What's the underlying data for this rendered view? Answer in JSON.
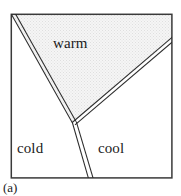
{
  "figure": {
    "caption": "(a)",
    "frame": {
      "left": 11,
      "top": 14,
      "right": 172,
      "bottom": 178,
      "stroke_color": "#3a3a3a",
      "stroke_width": 1.6
    },
    "shaded_region": {
      "name": "warm-sector",
      "fill_color": "#e9e9e9",
      "stipple": true
    },
    "boundary_style": {
      "stroke_color": "#2b2b2b",
      "stroke_width": 1.2,
      "double_line_gap": 3.2
    },
    "junction_point": {
      "x": 73,
      "y": 122
    },
    "boundaries": [
      {
        "name": "warm-front-left",
        "from": {
          "x": 12,
          "y": 15
        },
        "to": {
          "x": 73,
          "y": 122
        }
      },
      {
        "name": "warm-front-right",
        "from": {
          "x": 73,
          "y": 122
        },
        "to": {
          "x": 171,
          "y": 39
        }
      },
      {
        "name": "occlusion-vertical",
        "from": {
          "x": 73,
          "y": 122
        },
        "to": {
          "x": 91,
          "y": 178
        }
      }
    ],
    "labels": [
      {
        "key": "warm",
        "text": "warm"
      },
      {
        "key": "cold",
        "text": "cold"
      },
      {
        "key": "cool",
        "text": "cool"
      }
    ],
    "regions": {
      "warm": "warm",
      "cold": "cold",
      "cool": "cool"
    }
  }
}
